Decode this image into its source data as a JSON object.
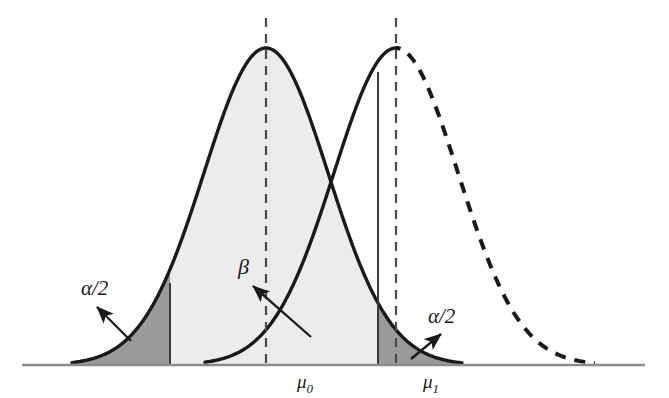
{
  "figure": {
    "title": "",
    "background_color": "#ffffff",
    "curve_color": "#1a1a1a",
    "axis_color": "#8c8c8c",
    "alpha_region_color": "#9a9a9a",
    "beta_region_color": "#ececec",
    "labels": {
      "alpha_left": "α/2",
      "beta": "β",
      "alpha_right": "α/2",
      "mu_null_base": "μ",
      "mu_null_sub": "0",
      "mu_alt_base": "μ",
      "mu_alt_sub": "1"
    }
  },
  "chart_data": {
    "type": "area",
    "title": "",
    "xlabel": "",
    "ylabel": "",
    "grid": false,
    "legend_position": "none",
    "axis": {
      "baseline_y_px": 365,
      "x_start_px": 22,
      "x_end_px": 645,
      "tick_labels": [
        "μ0",
        "μ1"
      ],
      "tick_positions_px": [
        266,
        396
      ]
    },
    "series": [
      {
        "name": "Null distribution (μ0)",
        "line_style": "solid",
        "peak_x_px": 266,
        "peak_y_px": 48,
        "tail_left_x_px": 72,
        "tail_right_x_px": 462,
        "sigma_px": 62
      },
      {
        "name": "Alternative distribution (μ1)",
        "line_style": "solid-left-dashed-right",
        "peak_x_px": 396,
        "peak_y_px": 48,
        "tail_left_x_px": 205,
        "tail_right_x_px": 595,
        "sigma_px": 62,
        "dash_starts_at_peak": true
      }
    ],
    "vertical_lines": [
      {
        "name": "mu0-center-line",
        "x_px": 266,
        "style": "dashed",
        "from_y_px": 18,
        "to_y_px": 365
      },
      {
        "name": "mu1-center-line",
        "x_px": 396,
        "style": "dashed",
        "from_y_px": 18,
        "to_y_px": 365
      },
      {
        "name": "lower-critical-value-line",
        "x_px": 170,
        "style": "solid",
        "from_y_px": 283,
        "to_y_px": 365
      },
      {
        "name": "upper-critical-value-line",
        "x_px": 378,
        "style": "solid",
        "from_y_px": 72,
        "to_y_px": 365
      }
    ],
    "shaded_regions": [
      {
        "name": "alpha-over-two-lower-tail",
        "label": "α/2",
        "color": "#9a9a9a",
        "under_series": "Null distribution (μ0)",
        "x_from_px": 72,
        "x_to_px": 170
      },
      {
        "name": "beta-region",
        "label": "β",
        "color": "#ececec",
        "under_series": "Null distribution (μ0)",
        "x_from_px": 170,
        "x_to_px": 378
      },
      {
        "name": "alpha-over-two-upper-tail",
        "label": "α/2",
        "color": "#9a9a9a",
        "under_series": "Null distribution (μ0)",
        "x_from_px": 378,
        "x_to_px": 462
      }
    ],
    "annotations": [
      {
        "name": "alpha-left-annotation",
        "text": "α/2",
        "text_x_px": 81,
        "text_y_px": 295,
        "arrow_from_px": [
          131,
          341
        ],
        "arrow_to_px": [
          97,
          307
        ]
      },
      {
        "name": "beta-annotation",
        "text": "β",
        "text_x_px": 238,
        "text_y_px": 274,
        "arrow_from_px": [
          311,
          337
        ],
        "arrow_to_px": [
          253,
          286
        ]
      },
      {
        "name": "alpha-right-annotation",
        "text": "α/2",
        "text_x_px": 428,
        "text_y_px": 323,
        "arrow_from_px": [
          411,
          359
        ],
        "arrow_to_px": [
          441,
          334
        ]
      }
    ]
  }
}
